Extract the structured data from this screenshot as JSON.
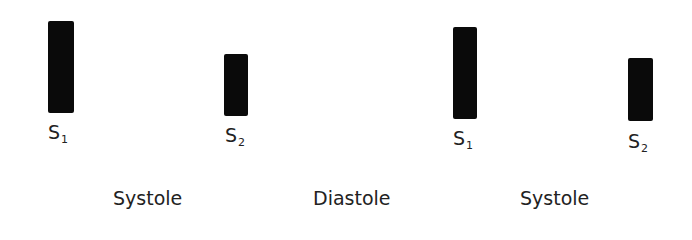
{
  "diagram": {
    "sounds": [
      {
        "id": "s1a",
        "letter": "S",
        "sub": "1",
        "bar": {
          "left": 48,
          "top": 21,
          "width": 26,
          "height": 92
        },
        "label_left": 48,
        "label_top": 123
      },
      {
        "id": "s2a",
        "letter": "S",
        "sub": "2",
        "bar": {
          "left": 224,
          "top": 54,
          "width": 24,
          "height": 62
        },
        "label_left": 225,
        "label_top": 126
      },
      {
        "id": "s1b",
        "letter": "S",
        "sub": "1",
        "bar": {
          "left": 453,
          "top": 27,
          "width": 24,
          "height": 92
        },
        "label_left": 453,
        "label_top": 129
      },
      {
        "id": "s2b",
        "letter": "S",
        "sub": "2",
        "bar": {
          "left": 628,
          "top": 58,
          "width": 25,
          "height": 63
        },
        "label_left": 628,
        "label_top": 132
      }
    ],
    "phases": [
      {
        "label": "Systole",
        "left": 113
      },
      {
        "label": "Diastole",
        "left": 313
      },
      {
        "label": "Systole",
        "left": 520
      }
    ],
    "colors": {
      "bar": "#0a0a0a",
      "text": "#222222",
      "background": "#ffffff"
    }
  }
}
